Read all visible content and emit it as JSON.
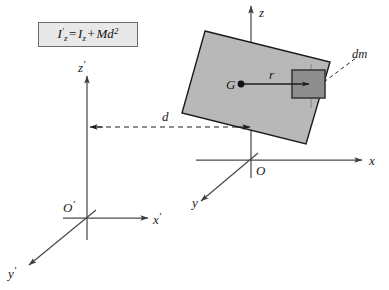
{
  "figure": {
    "caption_formula": {
      "lhs_symbol": "I",
      "lhs_sub": "z",
      "lhs_prime": "′",
      "equals": "=",
      "rhs_symbol": "I",
      "rhs_sub": "z",
      "plus": "+",
      "mass": "M",
      "distance": "d",
      "exponent": "2",
      "plain": "I'_z = I_z + Md^2"
    },
    "colors": {
      "body_fill": "#b8b8b8",
      "body_stroke": "#1a1a1a",
      "dm_fill": "#8e8e8e",
      "dm_stroke": "#3a3a3a",
      "axis": "#4a4a4a",
      "dashed": "#2b2b2b",
      "formula_box_fill": "#e8e8e8",
      "formula_box_border": "#6b6b6b",
      "text": "#1a1a1a",
      "background": "#ffffff"
    },
    "primed_frame": {
      "origin_label": "O",
      "origin_prime": "′",
      "z_label": "z",
      "z_prime": "′",
      "x_label": "x",
      "x_prime": "′",
      "y_label": "y",
      "y_prime": "′"
    },
    "body_frame": {
      "origin_label": "O",
      "z_label": "z",
      "x_label": "x",
      "y_label": "y"
    },
    "annotations": {
      "center_of_mass_label": "G",
      "radius_label": "r",
      "distance_label": "d",
      "mass_element_label": "dm"
    }
  }
}
